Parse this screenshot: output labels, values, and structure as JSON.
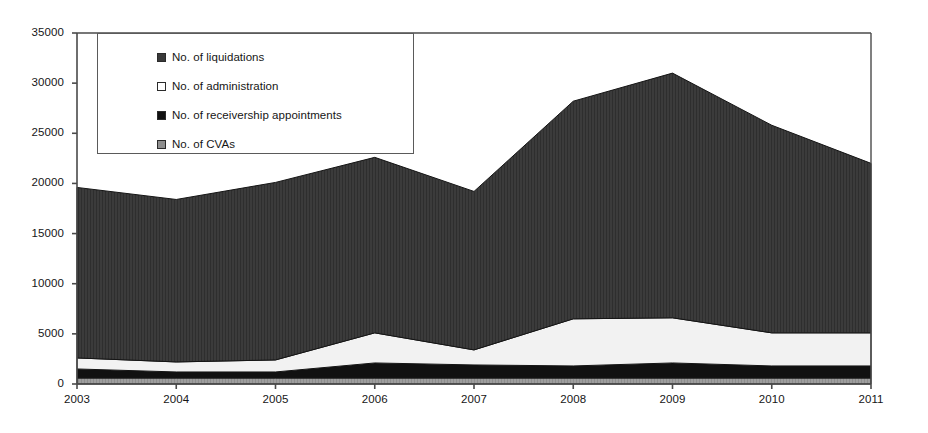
{
  "chart_data": {
    "type": "area",
    "stacked": true,
    "title": "",
    "subtitle": "",
    "xlabel": "",
    "ylabel": "",
    "categories": [
      "2003",
      "2004",
      "2005",
      "2006",
      "2007",
      "2008",
      "2009",
      "2010",
      "2011"
    ],
    "x": [
      2003,
      2004,
      2005,
      2006,
      2007,
      2008,
      2009,
      2010,
      2011
    ],
    "xlim": [
      2003,
      2011
    ],
    "ylim": [
      0,
      35000
    ],
    "ytick_values": [
      0,
      5000,
      10000,
      15000,
      20000,
      25000,
      30000,
      35000
    ],
    "ytick_labels": [
      "0",
      "5000",
      "10000",
      "15000",
      "20000",
      "25000",
      "30000",
      "35000"
    ],
    "xtick_labels": [
      "2003",
      "2004",
      "2005",
      "2006",
      "2007",
      "2008",
      "2009",
      "2010",
      "2011"
    ],
    "grid": false,
    "legend_position": "top-left-inset",
    "stack_order_bottom_to_top": [
      "No. of CVAs",
      "No. of receivership appointments",
      "No. of administration",
      "No. of liquidations"
    ],
    "series": [
      {
        "name": "No. of liquidations",
        "color": "#3a3a3a",
        "values": [
          17000,
          16200,
          17700,
          17500,
          15800,
          21700,
          24400,
          20700,
          16900
        ]
      },
      {
        "name": "No. of administration",
        "color": "#f4f4f4",
        "values": [
          1100,
          1000,
          1200,
          3000,
          1500,
          4700,
          4500,
          3300,
          3300
        ]
      },
      {
        "name": "No. of receivership appointments",
        "color": "#111111",
        "values": [
          900,
          600,
          600,
          1500,
          1300,
          1200,
          1500,
          1200,
          1200
        ]
      },
      {
        "name": "No. of CVAs",
        "color": "#9a9a9a",
        "values": [
          600,
          600,
          600,
          600,
          600,
          600,
          600,
          600,
          600
        ]
      }
    ],
    "totals": [
      19600,
      18400,
      20100,
      22600,
      19200,
      28200,
      31000,
      25800,
      22000
    ]
  },
  "legend": {
    "items": [
      {
        "label": "No. of liquidations",
        "swatch": "#3a3a3a"
      },
      {
        "label": "No. of administration",
        "swatch": "#ffffff"
      },
      {
        "label": "No. of receivership appointments",
        "swatch": "#111111"
      },
      {
        "label": "No. of CVAs",
        "swatch": "#8f8f8f"
      }
    ]
  }
}
